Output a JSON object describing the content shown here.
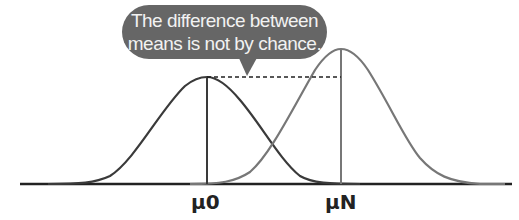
{
  "callout": {
    "line1": "The difference between",
    "line2": "means is not by chance."
  },
  "labels": {
    "mu_0": "μ0",
    "mu_n": "μN"
  },
  "colors": {
    "bubble": "#666666",
    "curve_null": "#3a3a3a",
    "curve_new": "#777777",
    "axis": "#222222"
  }
}
